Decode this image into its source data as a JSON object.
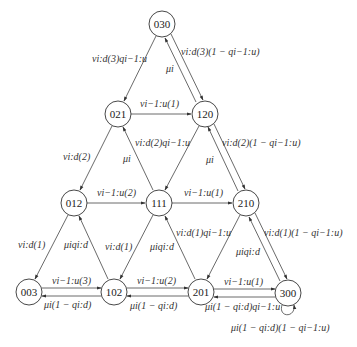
{
  "diagram": {
    "type": "state-transition",
    "nodes": [
      {
        "id": "030",
        "label": "030",
        "x": 162,
        "y": 24
      },
      {
        "id": "021",
        "label": "021",
        "x": 118,
        "y": 114
      },
      {
        "id": "120",
        "label": "120",
        "x": 205,
        "y": 114
      },
      {
        "id": "012",
        "label": "012",
        "x": 74,
        "y": 203
      },
      {
        "id": "111",
        "label": "111",
        "x": 159,
        "y": 203
      },
      {
        "id": "210",
        "label": "210",
        "x": 246,
        "y": 203
      },
      {
        "id": "003",
        "label": "003",
        "x": 29,
        "y": 292
      },
      {
        "id": "102",
        "label": "102",
        "x": 114,
        "y": 292
      },
      {
        "id": "201",
        "label": "201",
        "x": 201,
        "y": 292
      },
      {
        "id": "300",
        "label": "300",
        "x": 288,
        "y": 293
      }
    ],
    "edges": [
      {
        "from": "030",
        "to": "021",
        "label": "ν_{i:d}(3)q_{i−1:u}"
      },
      {
        "from": "030",
        "to": "120",
        "label": "ν_{i:d}(3)(1 − q_{i−1:u})"
      },
      {
        "from": "120",
        "to": "030",
        "label": "μ_i"
      },
      {
        "from": "021",
        "to": "120",
        "label": "ν_{i−1:u}(1)"
      },
      {
        "from": "021",
        "to": "012",
        "label": "ν_{i:d}(2)"
      },
      {
        "from": "111",
        "to": "021",
        "label": "μ_i"
      },
      {
        "from": "120",
        "to": "111",
        "label": "ν_{i:d}(2)q_{i−1:u}"
      },
      {
        "from": "120",
        "to": "210",
        "label": "ν_{i:d}(2)(1 − q_{i−1:u})"
      },
      {
        "from": "210",
        "to": "120",
        "label": "μ_i"
      },
      {
        "from": "012",
        "to": "111",
        "label": "ν_{i−1:u}(2)"
      },
      {
        "from": "111",
        "to": "210",
        "label": "ν_{i−1:u}(1)"
      },
      {
        "from": "012",
        "to": "003",
        "label": "ν_{i:d}(1)"
      },
      {
        "from": "102",
        "to": "012",
        "label": "μ_i q_{i:d}"
      },
      {
        "from": "111",
        "to": "102",
        "label": "ν_{i:d}(1)"
      },
      {
        "from": "201",
        "to": "111",
        "label": "μ_i q_{i:d}"
      },
      {
        "from": "210",
        "to": "201",
        "label": "ν_{i:d}(1)q_{i−1:u}"
      },
      {
        "from": "210",
        "to": "300",
        "label": "ν_{i:d}(1)(1 − q_{i−1:u})"
      },
      {
        "from": "300",
        "to": "210",
        "label": "μ_i q_{i:d}"
      },
      {
        "from": "003",
        "to": "102",
        "label": "ν_{i−1:u}(3)"
      },
      {
        "from": "102",
        "to": "003",
        "label": "μ_i(1 − q_{i:d})"
      },
      {
        "from": "102",
        "to": "201",
        "label": "ν_{i−1:u}(2)"
      },
      {
        "from": "201",
        "to": "102",
        "label": "μ_i(1 − q_{i:d})"
      },
      {
        "from": "201",
        "to": "300",
        "label": "ν_{i−1:u}(1)"
      },
      {
        "from": "300",
        "to": "201",
        "label": "μ_i(1 − q_{i:d})q_{i−1:u}"
      },
      {
        "from": "300",
        "to": "300",
        "label": "μ_i(1 − q_{i:d})(1 − q_{i−1:u})"
      }
    ]
  },
  "labels": {
    "e030_021": "νi:d(3)qi−1:u",
    "e030_120": "νi:d(3)(1 − qi−1:u)",
    "e120_030": "μi",
    "e021_120": "νi−1:u(1)",
    "e021_012": "νi:d(2)",
    "e111_021": "μi",
    "e120_111": "νi:d(2)qi−1:u",
    "e120_210": "νi:d(2)(1 − qi−1:u)",
    "e210_120": "μi",
    "e012_111": "νi−1:u(2)",
    "e111_210": "νi−1:u(1)",
    "e012_003": "νi:d(1)",
    "e102_012": "μiqi:d",
    "e111_102": "νi:d(1)",
    "e201_111": "μiqi:d",
    "e210_201": "νi:d(1)qi−1:u",
    "e210_300": "νi:d(1)(1 − qi−1:u)",
    "e300_210": "μiqi:d",
    "e003_102": "νi−1:u(3)",
    "e102_003": "μi(1 − qi:d)",
    "e102_201": "νi−1:u(2)",
    "e201_102": "μi(1 − qi:d)",
    "e201_300": "νi−1:u(1)",
    "e300_201": "μi(1 − qi:d)qi−1:u",
    "e300_300": "μi(1 − qi:d)(1 − qi−1:u)"
  },
  "node_labels": {
    "n030": "030",
    "n021": "021",
    "n120": "120",
    "n012": "012",
    "n111": "111",
    "n210": "210",
    "n003": "003",
    "n102": "102",
    "n201": "201",
    "n300": "300"
  }
}
